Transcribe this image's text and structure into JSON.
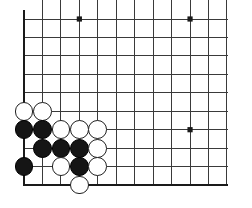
{
  "figure": {
    "kind": "go-board-diagram",
    "board_size": 19,
    "visible_corner": "bottom-left"
  },
  "board": {
    "line_color": "#3a3a3a",
    "edge_color": "#1a1a1a",
    "background_color": "#ffffff",
    "origin_x": 24,
    "origin_y": 19,
    "spacing": 18.45,
    "cols_visible": 12,
    "rows_visible": 10,
    "left_edge_is_board_edge": true,
    "bottom_edge_is_board_edge": true,
    "star_points": [
      {
        "col": 4,
        "row": 1
      },
      {
        "col": 10,
        "row": 1
      },
      {
        "col": 10,
        "row": 7
      }
    ],
    "star_radius": 2.6
  },
  "stones": {
    "radius": 9.4,
    "black_color": "#151515",
    "white_color": "#ffffff",
    "items": [
      {
        "col": 1,
        "row": 6,
        "color": "white"
      },
      {
        "col": 2,
        "row": 6,
        "color": "white"
      },
      {
        "col": 1,
        "row": 7,
        "color": "black"
      },
      {
        "col": 2,
        "row": 7,
        "color": "black"
      },
      {
        "col": 3,
        "row": 7,
        "color": "white"
      },
      {
        "col": 4,
        "row": 7,
        "color": "white"
      },
      {
        "col": 5,
        "row": 7,
        "color": "white"
      },
      {
        "col": 2,
        "row": 8,
        "color": "black"
      },
      {
        "col": 3,
        "row": 8,
        "color": "black"
      },
      {
        "col": 4,
        "row": 8,
        "color": "black"
      },
      {
        "col": 5,
        "row": 8,
        "color": "white"
      },
      {
        "col": 1,
        "row": 9,
        "color": "black"
      },
      {
        "col": 3,
        "row": 9,
        "color": "white"
      },
      {
        "col": 4,
        "row": 9,
        "color": "black"
      },
      {
        "col": 5,
        "row": 9,
        "color": "white"
      },
      {
        "col": 4,
        "row": 10,
        "color": "white"
      }
    ]
  }
}
